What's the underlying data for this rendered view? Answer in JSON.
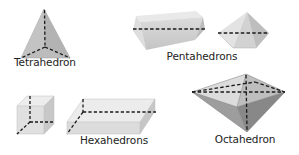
{
  "diagram": {
    "shapes": [
      {
        "id": "tetrahedron",
        "label": "Tetrahedron",
        "faces": 4
      },
      {
        "id": "pentahedron-prism",
        "group": "Pentahedrons",
        "faces": 5
      },
      {
        "id": "pentahedron-pyramid",
        "group": "Pentahedrons",
        "faces": 5
      },
      {
        "id": "hexahedron-cube",
        "group": "Hexahedrons",
        "faces": 6
      },
      {
        "id": "hexahedron-box",
        "group": "Hexahedrons",
        "faces": 6
      },
      {
        "id": "octahedron",
        "label": "Octahedron",
        "faces": 8
      }
    ],
    "labels": {
      "tetrahedron": "Tetrahedron",
      "pentahedrons": "Pentahedrons",
      "hexahedrons": "Hexahedrons",
      "octahedron": "Octahedron"
    },
    "colors": {
      "face_light": "#e6e6e6",
      "face_mid": "#cfcfcf",
      "face_dark": "#a9a9a9",
      "tetra_face": "#bdbdbd",
      "hidden_edge": "#1a1a1a",
      "text": "#222222",
      "background": "#ffffff"
    }
  }
}
